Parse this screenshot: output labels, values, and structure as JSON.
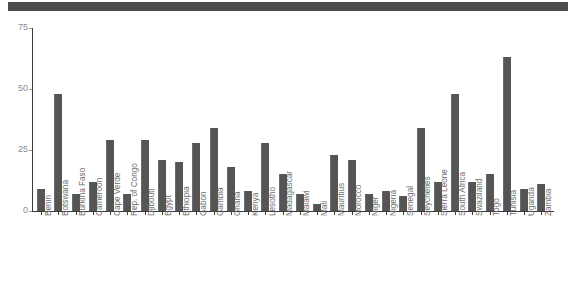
{
  "chart_data": {
    "type": "bar",
    "title": "",
    "subtitle": "",
    "xlabel": "",
    "ylabel": "",
    "ylim": [
      0,
      75
    ],
    "yticks": [
      0,
      25,
      50,
      75
    ],
    "ytick_labels": [
      "0",
      "25",
      "50",
      "75"
    ],
    "grid": false,
    "legend": null,
    "orientation": "vertical",
    "bar_color": "#555555",
    "axis_color": "#3c3c3c",
    "tick_label_color": "#8c8c8c",
    "xtick_label_rotation": -90,
    "categories": [
      "Benin",
      "Botswana",
      "Burkina Faso",
      "Cameroon",
      "Cape Verde",
      "Rep. of Congo",
      "Djibouti",
      "Egypt",
      "Ethiopia",
      "Gabon",
      "Gambia",
      "Ghana",
      "Kenya",
      "Lesotho",
      "Madagascar",
      "Malawi",
      "Mali",
      "Mauritius",
      "Morocco",
      "Niger",
      "Nigeria",
      "Senegal",
      "Seychelles",
      "Sierra Leone",
      "South Africa",
      "Swaziland",
      "Togo",
      "Tunisia",
      "Uganda",
      "Zambia"
    ],
    "values": [
      9,
      48,
      7,
      12,
      29,
      7,
      29,
      21,
      20,
      28,
      34,
      18,
      8,
      28,
      15,
      7,
      3,
      23,
      21,
      7,
      8,
      6,
      34,
      12,
      48,
      12,
      15,
      63,
      9,
      11
    ]
  },
  "figure": {
    "top_band_color": "#4d4d4d"
  }
}
